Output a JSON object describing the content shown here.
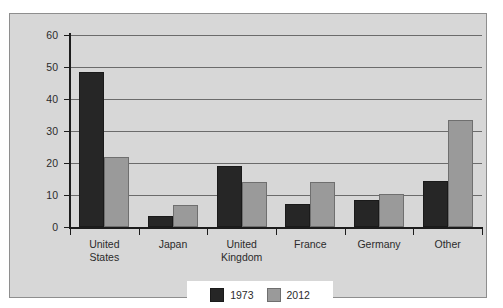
{
  "chart_data": {
    "type": "bar",
    "title": "",
    "subtitle": "",
    "xlabel": "",
    "ylabel": "",
    "ylim": [
      0,
      60
    ],
    "yticks": [
      0,
      10,
      20,
      30,
      40,
      50,
      60
    ],
    "ytick_labels": [
      "0",
      "10",
      "20",
      "30",
      "40",
      "50",
      "60"
    ],
    "grid": true,
    "legend_position": "bottom",
    "categories": [
      "United States",
      "Japan",
      "United Kingdom",
      "France",
      "Germany",
      "Other"
    ],
    "category_display": [
      "United\nStates",
      "Japan",
      "United\nKingdom",
      "France",
      "Germany",
      "Other"
    ],
    "series": [
      {
        "name": "1973",
        "color": "#262626",
        "values": [
          48.5,
          3.5,
          19.0,
          7.3,
          8.3,
          14.3
        ]
      },
      {
        "name": "2012",
        "color": "#9a9a9a",
        "values": [
          22.0,
          7.0,
          14.0,
          14.1,
          10.4,
          33.5
        ]
      }
    ]
  },
  "legend": {
    "entries": [
      {
        "label": "1973"
      },
      {
        "label": "2012"
      }
    ]
  },
  "colors": {
    "series_1973": "#262626",
    "series_2012": "#9a9a9a",
    "plot_background": "#d7d7d7",
    "frame_border": "#8e8e8e",
    "gridline": "#6b6b6b",
    "axis": "#1c1c1c",
    "page_background": "#ffffff",
    "legend_background": "#ffffff"
  }
}
